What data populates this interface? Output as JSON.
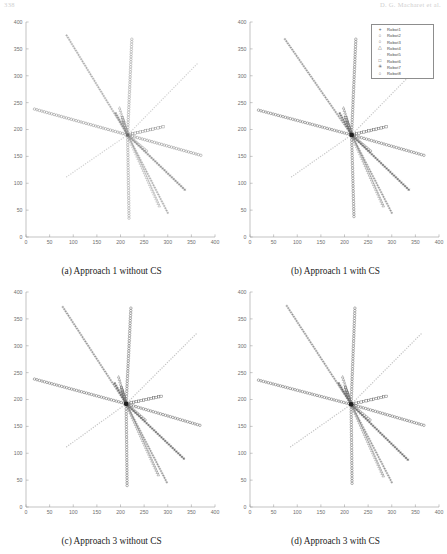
{
  "header": {
    "page_number": "338",
    "running_head": "D. G. Macharet et al."
  },
  "figure": {
    "panels": [
      {
        "id": "a",
        "caption": "(a) Approach 1 without CS"
      },
      {
        "id": "b",
        "caption": "(b) Approach 1 with CS"
      },
      {
        "id": "c",
        "caption": "(c) Approach 3 without CS"
      },
      {
        "id": "d",
        "caption": "(d) Approach 3 with CS"
      }
    ]
  },
  "legend": {
    "position": "top-right",
    "entries": [
      {
        "marker": "+",
        "glyph": "+",
        "label": "Robot1",
        "color": "#555555"
      },
      {
        "marker": "o",
        "glyph": "○",
        "label": "Robot2",
        "color": "#555555"
      },
      {
        "marker": "o",
        "glyph": "○",
        "label": "Robot3",
        "color": "#555555"
      },
      {
        "marker": "triangle",
        "glyph": "△",
        "label": "Robot4",
        "color": "#555555"
      },
      {
        "marker": "dot",
        "glyph": "·",
        "label": "Robot5",
        "color": "#bdbdbd"
      },
      {
        "marker": "square",
        "glyph": "□",
        "label": "Robot6",
        "color": "#555555"
      },
      {
        "marker": "star",
        "glyph": "✳",
        "label": "Robot7",
        "color": "#555555"
      },
      {
        "marker": "circle",
        "glyph": "○",
        "label": "Robot8",
        "color": "#555555"
      }
    ]
  },
  "chart_data": {
    "type": "scatter",
    "title": "",
    "xlabel": "",
    "ylabel": "",
    "xlim": [
      0,
      400
    ],
    "ylim": [
      0,
      400
    ],
    "xticks": [
      0,
      50,
      100,
      150,
      200,
      250,
      300,
      350,
      400
    ],
    "yticks": [
      0,
      50,
      100,
      150,
      200,
      250,
      300,
      350,
      400
    ],
    "grid": false,
    "legend_position": "top-right",
    "panels": [
      {
        "id": "a",
        "caption": "(a) Approach 1 without CS",
        "show_legend": false,
        "rendezvous": [
          215,
          190
        ],
        "series": [
          {
            "name": "Robot1",
            "marker": "+",
            "color": "#8a8a8a",
            "start": [
              86,
              375
            ],
            "end": [
              300,
              45
            ]
          },
          {
            "name": "Robot2",
            "marker": "o",
            "color": "#909090",
            "start": [
              224,
              368
            ],
            "end": [
              218,
              35
            ]
          },
          {
            "name": "Robot3",
            "marker": "o",
            "color": "#7d7d7d",
            "start": [
              18,
              238
            ],
            "end": [
              370,
              152
            ]
          },
          {
            "name": "Robot4",
            "marker": "△",
            "color": "#9a9a9a",
            "start": [
              198,
              240
            ],
            "end": [
              282,
              58
            ]
          },
          {
            "name": "Robot5",
            "marker": "·",
            "color": "#d2d2d2",
            "start": [
              86,
              112
            ],
            "end": [
              362,
              322
            ]
          },
          {
            "name": "Robot6",
            "marker": "□",
            "color": "#8c8c8c",
            "start": [
              204,
              222
            ],
            "end": [
              290,
              205
            ]
          },
          {
            "name": "Robot7",
            "marker": "✳",
            "color": "#868686",
            "start": [
              190,
              230
            ],
            "end": [
              336,
              88
            ]
          },
          {
            "name": "Robot8",
            "marker": "○",
            "color": "#949494",
            "start": [
              206,
              215
            ],
            "end": [
              255,
              160
            ]
          }
        ]
      },
      {
        "id": "b",
        "caption": "(b) Approach 1 with CS",
        "show_legend": true,
        "rendezvous": [
          215,
          190
        ],
        "series": [
          {
            "name": "Robot1",
            "marker": "+",
            "color": "#6e6e6e",
            "start": [
              74,
              368
            ],
            "end": [
              300,
              45
            ]
          },
          {
            "name": "Robot2",
            "marker": "o",
            "color": "#5f5f5f",
            "start": [
              224,
              368
            ],
            "end": [
              220,
              38
            ]
          },
          {
            "name": "Robot3",
            "marker": "o",
            "color": "#5a5a5a",
            "start": [
              18,
              236
            ],
            "end": [
              368,
              152
            ]
          },
          {
            "name": "Robot4",
            "marker": "△",
            "color": "#7b7b7b",
            "start": [
              198,
              240
            ],
            "end": [
              282,
              58
            ]
          },
          {
            "name": "Robot5",
            "marker": "·",
            "color": "#c9c9c9",
            "start": [
              88,
              112
            ],
            "end": [
              360,
              320
            ]
          },
          {
            "name": "Robot6",
            "marker": "□",
            "color": "#6b6b6b",
            "start": [
              203,
              222
            ],
            "end": [
              288,
              205
            ]
          },
          {
            "name": "Robot7",
            "marker": "✳",
            "color": "#626262",
            "start": [
              190,
              230
            ],
            "end": [
              336,
              88
            ]
          },
          {
            "name": "Robot8",
            "marker": "○",
            "color": "#707070",
            "start": [
              206,
              215
            ],
            "end": [
              255,
              160
            ]
          }
        ]
      },
      {
        "id": "c",
        "caption": "(c) Approach 3 without CS",
        "show_legend": false,
        "rendezvous": [
          212,
          192
        ],
        "series": [
          {
            "name": "Robot1",
            "marker": "+",
            "color": "#6a6a6a",
            "start": [
              78,
              372
            ],
            "end": [
              298,
              46
            ]
          },
          {
            "name": "Robot2",
            "marker": "o",
            "color": "#5c5c5c",
            "start": [
              222,
              370
            ],
            "end": [
              214,
              40
            ]
          },
          {
            "name": "Robot3",
            "marker": "o",
            "color": "#565656",
            "start": [
              18,
              238
            ],
            "end": [
              368,
              152
            ]
          },
          {
            "name": "Robot4",
            "marker": "△",
            "color": "#787878",
            "start": [
              196,
              242
            ],
            "end": [
              280,
              60
            ]
          },
          {
            "name": "Robot5",
            "marker": "·",
            "color": "#c6c6c6",
            "start": [
              86,
              112
            ],
            "end": [
              360,
              322
            ]
          },
          {
            "name": "Robot6",
            "marker": "□",
            "color": "#676767",
            "start": [
              202,
              222
            ],
            "end": [
              286,
              206
            ]
          },
          {
            "name": "Robot7",
            "marker": "✳",
            "color": "#5e5e5e",
            "start": [
              188,
              230
            ],
            "end": [
              334,
              90
            ]
          },
          {
            "name": "Robot8",
            "marker": "○",
            "color": "#6d6d6d",
            "start": [
              204,
              216
            ],
            "end": [
              252,
              162
            ]
          }
        ]
      },
      {
        "id": "d",
        "caption": "(d) Approach 3 with CS",
        "show_legend": false,
        "rendezvous": [
          214,
          191
        ],
        "series": [
          {
            "name": "Robot1",
            "marker": "+",
            "color": "#6a6a6a",
            "start": [
              78,
              374
            ],
            "end": [
              300,
              46
            ]
          },
          {
            "name": "Robot2",
            "marker": "o",
            "color": "#5c5c5c",
            "start": [
              222,
              370
            ],
            "end": [
              216,
              44
            ]
          },
          {
            "name": "Robot3",
            "marker": "o",
            "color": "#565656",
            "start": [
              18,
              236
            ],
            "end": [
              368,
              152
            ]
          },
          {
            "name": "Robot4",
            "marker": "△",
            "color": "#787878",
            "start": [
              196,
              242
            ],
            "end": [
              282,
              58
            ]
          },
          {
            "name": "Robot5",
            "marker": "·",
            "color": "#c6c6c6",
            "start": [
              86,
              112
            ],
            "end": [
              362,
              322
            ]
          },
          {
            "name": "Robot6",
            "marker": "□",
            "color": "#676767",
            "start": [
              202,
              222
            ],
            "end": [
              288,
              206
            ]
          },
          {
            "name": "Robot7",
            "marker": "✳",
            "color": "#5e5e5e",
            "start": [
              188,
              230
            ],
            "end": [
              334,
              88
            ]
          },
          {
            "name": "Robot8",
            "marker": "○",
            "color": "#6d6d6d",
            "start": [
              204,
              216
            ],
            "end": [
              254,
              162
            ]
          }
        ]
      }
    ]
  }
}
